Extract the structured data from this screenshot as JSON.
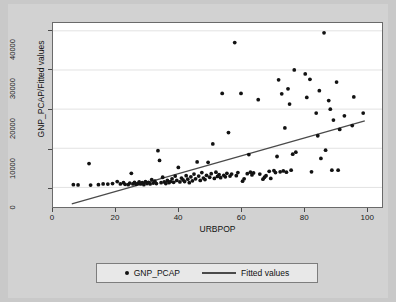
{
  "figure": {
    "background_color": "#d2d2d2",
    "page_background_color": "#c9c9c9",
    "plot_background_color": "#ffffff"
  },
  "axes": {
    "y_title": "GNP_PCAP/Fitted values",
    "x_title": "URBPOP",
    "y_ticks": [
      "0",
      "10000",
      "20000",
      "30000",
      "40000"
    ],
    "x_ticks": [
      "0",
      "20",
      "40",
      "60",
      "80",
      "100"
    ]
  },
  "legend": {
    "scatter_label": "GNP_PCAP",
    "line_label": "Fitted values"
  },
  "chart_data": {
    "type": "scatter",
    "title": "",
    "xlabel": "URBPOP",
    "ylabel": "GNP_PCAP/Fitted values",
    "xlim": [
      0,
      105
    ],
    "ylim": [
      -5000,
      42000
    ],
    "xticks": [
      0,
      20,
      40,
      60,
      80,
      100
    ],
    "yticks": [
      0,
      10000,
      20000,
      30000,
      40000
    ],
    "grid": "horizontal",
    "legend_position": "below-axes",
    "series": [
      {
        "name": "GNP_PCAP",
        "type": "scatter",
        "marker": "filled-circle",
        "color": "#121212",
        "points": [
          [
            6.5,
            700
          ],
          [
            8.0,
            650
          ],
          [
            11.5,
            6100
          ],
          [
            12.0,
            600
          ],
          [
            14.5,
            700
          ],
          [
            16.0,
            900
          ],
          [
            17.5,
            850
          ],
          [
            19.0,
            1000
          ],
          [
            20.5,
            1500
          ],
          [
            21.5,
            900
          ],
          [
            22.5,
            1200
          ],
          [
            23.0,
            800
          ],
          [
            24.0,
            700
          ],
          [
            24.5,
            1100
          ],
          [
            25.0,
            3600
          ],
          [
            25.5,
            900
          ],
          [
            26.0,
            1300
          ],
          [
            26.5,
            800
          ],
          [
            27.0,
            1000
          ],
          [
            27.5,
            1400
          ],
          [
            28.0,
            900
          ],
          [
            28.5,
            1200
          ],
          [
            29.0,
            700
          ],
          [
            29.5,
            1500
          ],
          [
            30.0,
            1000
          ],
          [
            30.5,
            1300
          ],
          [
            31.0,
            900
          ],
          [
            31.5,
            2000
          ],
          [
            32.0,
            1100
          ],
          [
            32.5,
            1600
          ],
          [
            33.0,
            1000
          ],
          [
            33.5,
            9400
          ],
          [
            34.0,
            6900
          ],
          [
            34.5,
            1200
          ],
          [
            35.0,
            2600
          ],
          [
            35.5,
            1400
          ],
          [
            36.0,
            1000
          ],
          [
            36.5,
            1800
          ],
          [
            37.0,
            1200
          ],
          [
            37.5,
            1500
          ],
          [
            38.0,
            2200
          ],
          [
            38.5,
            1300
          ],
          [
            39.0,
            2900
          ],
          [
            39.5,
            1800
          ],
          [
            40.0,
            5100
          ],
          [
            40.5,
            1400
          ],
          [
            41.0,
            2400
          ],
          [
            41.5,
            1900
          ],
          [
            42.0,
            1500
          ],
          [
            42.5,
            3000
          ],
          [
            43.0,
            2100
          ],
          [
            43.5,
            1200
          ],
          [
            44.0,
            2700
          ],
          [
            44.5,
            1700
          ],
          [
            45.0,
            3400
          ],
          [
            45.5,
            2200
          ],
          [
            46.0,
            6500
          ],
          [
            46.5,
            2900
          ],
          [
            47.0,
            1800
          ],
          [
            47.5,
            3800
          ],
          [
            48.0,
            2400
          ],
          [
            48.5,
            2000
          ],
          [
            49.0,
            3100
          ],
          [
            49.5,
            6400
          ],
          [
            50.0,
            2600
          ],
          [
            50.5,
            3500
          ],
          [
            51.0,
            11100
          ],
          [
            51.5,
            2300
          ],
          [
            52.0,
            3900
          ],
          [
            52.5,
            2800
          ],
          [
            53.0,
            3300
          ],
          [
            53.5,
            2500
          ],
          [
            54.0,
            24000
          ],
          [
            54.5,
            3100
          ],
          [
            55.0,
            2700
          ],
          [
            55.5,
            3600
          ],
          [
            56.0,
            14000
          ],
          [
            56.5,
            2900
          ],
          [
            57.0,
            3400
          ],
          [
            58.0,
            37000
          ],
          [
            58.5,
            3000
          ],
          [
            59.0,
            3800
          ],
          [
            60.0,
            24000
          ],
          [
            60.5,
            1600
          ],
          [
            61.0,
            2200
          ],
          [
            62.0,
            3500
          ],
          [
            62.5,
            8400
          ],
          [
            63.0,
            3900
          ],
          [
            63.5,
            3200
          ],
          [
            64.0,
            3700
          ],
          [
            65.5,
            22400
          ],
          [
            66.0,
            3400
          ],
          [
            67.0,
            2100
          ],
          [
            67.5,
            2600
          ],
          [
            68.0,
            3000
          ],
          [
            69.0,
            4100
          ],
          [
            69.5,
            2300
          ],
          [
            70.5,
            4300
          ],
          [
            71.0,
            3800
          ],
          [
            71.5,
            7900
          ],
          [
            72.0,
            27500
          ],
          [
            72.5,
            4000
          ],
          [
            73.0,
            23900
          ],
          [
            73.5,
            4200
          ],
          [
            74.0,
            15200
          ],
          [
            74.5,
            3900
          ],
          [
            75.0,
            25200
          ],
          [
            75.5,
            21300
          ],
          [
            76.0,
            4400
          ],
          [
            76.5,
            8500
          ],
          [
            77.0,
            30000
          ],
          [
            77.5,
            9000
          ],
          [
            80.5,
            29000
          ],
          [
            81.0,
            23000
          ],
          [
            82.0,
            27600
          ],
          [
            82.5,
            4000
          ],
          [
            84.0,
            19000
          ],
          [
            84.5,
            13200
          ],
          [
            85.0,
            24700
          ],
          [
            85.5,
            7400
          ],
          [
            86.5,
            39500
          ],
          [
            87.0,
            9500
          ],
          [
            88.0,
            22200
          ],
          [
            88.5,
            20000
          ],
          [
            89.0,
            4400
          ],
          [
            89.5,
            17200
          ],
          [
            90.5,
            26900
          ],
          [
            91.0,
            4400
          ],
          [
            91.5,
            14800
          ],
          [
            93.0,
            18300
          ],
          [
            95.5,
            15800
          ],
          [
            96.0,
            23100
          ],
          [
            99.0,
            19000
          ]
        ]
      },
      {
        "name": "Fitted values",
        "type": "line",
        "color": "#4a4a4a",
        "endpoints": [
          [
            6.0,
            -4200
          ],
          [
            99.5,
            17000
          ]
        ]
      }
    ]
  }
}
